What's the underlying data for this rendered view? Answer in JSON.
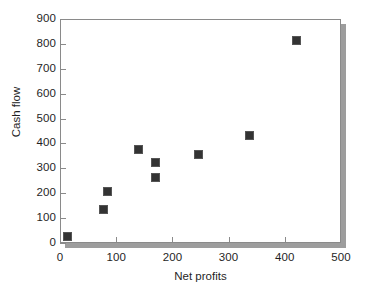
{
  "chart_data": {
    "type": "scatter",
    "title": "",
    "xlabel": "Net profits",
    "ylabel": "Cash flow",
    "xlim": [
      0,
      500
    ],
    "ylim": [
      0,
      900
    ],
    "xticks": [
      0,
      100,
      200,
      300,
      400,
      500
    ],
    "yticks": [
      0,
      100,
      200,
      300,
      400,
      500,
      600,
      700,
      800,
      900
    ],
    "xtick_labels": [
      "0",
      "100",
      "200",
      "300",
      "400",
      "500"
    ],
    "ytick_labels": [
      "0",
      "100",
      "200",
      "300",
      "400",
      "500",
      "600",
      "700",
      "800",
      "900"
    ],
    "grid": false,
    "legend": null,
    "marker": "square",
    "marker_color": "#333333",
    "series": [
      {
        "name": "Cash flow vs Net profits",
        "points": [
          {
            "x": 13,
            "y": 28
          },
          {
            "x": 78,
            "y": 133
          },
          {
            "x": 84,
            "y": 205
          },
          {
            "x": 140,
            "y": 374
          },
          {
            "x": 170,
            "y": 325
          },
          {
            "x": 170,
            "y": 265
          },
          {
            "x": 247,
            "y": 354
          },
          {
            "x": 338,
            "y": 430
          },
          {
            "x": 420,
            "y": 815
          }
        ]
      }
    ]
  },
  "axes": {
    "frame_color": "#8a8a8a",
    "shadow_color": "#9d9d9d"
  }
}
